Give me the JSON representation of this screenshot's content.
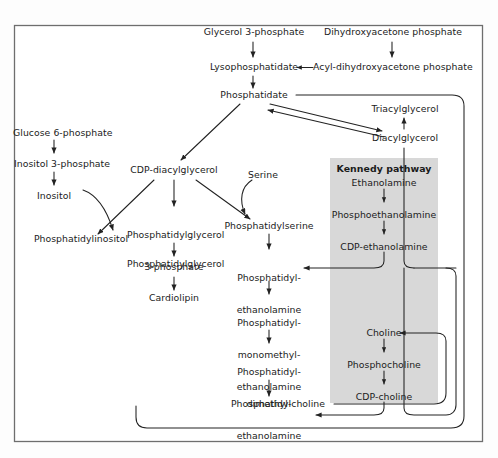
{
  "figure": {
    "frame": {
      "stroke": "#6e6e6e",
      "fill": "#ffffff"
    },
    "colors": {
      "text": "#1b1b1b",
      "arrow": "#222222",
      "highlight_box_fill": "#d8d8d8",
      "frame_stroke": "#6e6e6e"
    },
    "highlight_box": {
      "label": "Kennedy pathway",
      "fill": "#d8d8d8"
    }
  },
  "nodes": {
    "glycerol_3_phosphate": "Glycerol 3-phosphate",
    "dihydroxyacetone_phosphate": "Dihydroxyacetone phosphate",
    "lysophosphatidate": "Lysophosphatidate",
    "acyl_dihydroxyacetone_phosphate": "Acyl-dihydroxyacetone phosphate",
    "phosphatidate": "Phosphatidate",
    "triacylglycerol": "Triacylglycerol",
    "diacylglycerol": "Diacylglycerol",
    "glucose_6_phosphate": "Glucose 6-phosphate",
    "inositol_3_phosphate": "Inositol 3-phosphate",
    "inositol": "Inositol",
    "phosphatidylinositol": "Phosphatidylinositol",
    "cdp_diacylglycerol": "CDP-diacylglycerol",
    "serine": "Serine",
    "phosphatidylglycerol_3_phosphate_l1": "Phosphatidylglycerol",
    "phosphatidylglycerol_3_phosphate_l2": "3-phosphate",
    "phosphatidylglycerol": "Phosphatidylglycerol",
    "cardiolipin": "Cardiolipin",
    "phosphatidylserine": "Phosphatidylserine",
    "phosphatidylethanolamine_l1": "Phosphatidyl-",
    "phosphatidylethanolamine_l2": "ethanolamine",
    "phosphatidylmonomethylethanolamine_l1": "Phosphatidyl-",
    "phosphatidylmonomethylethanolamine_l2": "monomethyl-",
    "phosphatidylmonomethylethanolamine_l3": "ethanolamine",
    "phosphatidyldimethylethanolamine_l1": "Phosphatidyl-",
    "phosphatidyldimethylethanolamine_l2": "dimethyl-",
    "phosphatidyldimethylethanolamine_l3": "ethanolamine",
    "phosphatidylcholine": "Phosphatidylcholine",
    "kennedy_pathway": "Kennedy pathway",
    "ethanolamine": "Ethanolamine",
    "phosphoethanolamine": "Phosphoethanolamine",
    "cdp_ethanolamine": "CDP-ethanolamine",
    "choline": "Choline",
    "phosphocholine": "Phosphocholine",
    "cdp_choline": "CDP-choline"
  }
}
